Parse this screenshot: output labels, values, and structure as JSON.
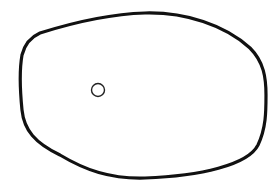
{
  "diagram": {
    "background": "#ffffff",
    "stroke_color": "#111111",
    "outline": {
      "shape": "rounded-blob",
      "stroke_width": 3.2
    },
    "marker": {
      "shape": "circle",
      "cx": 98,
      "cy": 90,
      "r": 6.5,
      "stroke_width": 1.4
    }
  }
}
